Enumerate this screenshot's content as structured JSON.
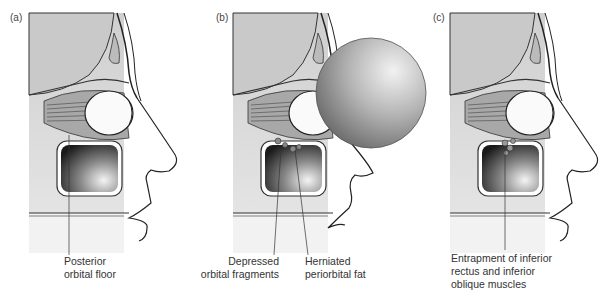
{
  "panels": [
    {
      "id": "a",
      "label": "(a)",
      "captions": [
        {
          "lines": [
            "Posterior",
            "orbital floor"
          ]
        }
      ]
    },
    {
      "id": "b",
      "label": "(b)",
      "captions": [
        {
          "lines": [
            "Depressed",
            "orbital fragments"
          ]
        },
        {
          "lines": [
            "Herniated",
            "periorbital fat"
          ]
        }
      ]
    },
    {
      "id": "c",
      "label": "(c)",
      "captions": [
        {
          "lines": [
            "Entrapment of inferior",
            "rectus and inferior",
            "oblique muscles"
          ]
        }
      ]
    }
  ],
  "colors": {
    "skull_fill": "#d4d4d4",
    "sinus_dark": "#2a2a2a",
    "line": "#222222",
    "sphere": "#9a9a9a"
  }
}
